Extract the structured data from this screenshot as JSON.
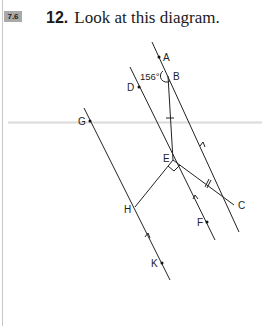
{
  "section_badge": "7.6",
  "question": {
    "number": "12.",
    "text": "Look at this diagram."
  },
  "diagram": {
    "points": {
      "A": "A",
      "B": "B",
      "C": "C",
      "D": "D",
      "E": "E",
      "F": "F",
      "G": "G",
      "H": "H",
      "K": "K"
    },
    "angle_label": "156°",
    "marks": {
      "right_angle_at": "E",
      "equal_ticks": [
        "BE",
        "EC"
      ],
      "parallel_arrows": [
        "AB-C line",
        "D-E-F line",
        "G-H-K line"
      ]
    }
  }
}
